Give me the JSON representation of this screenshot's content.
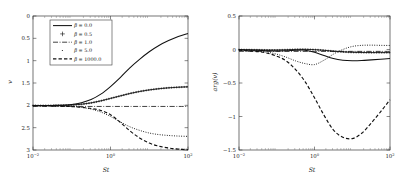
{
  "figure": {
    "background": "#ffffff",
    "ink": "#111111",
    "panels": [
      "magnitude",
      "phase"
    ]
  },
  "chart_data": [
    {
      "type": "line",
      "id": "left-panel",
      "title": "",
      "xlabel": "St",
      "ylabel": "v",
      "xscale": "log",
      "xlim": [
        0.01,
        100
      ],
      "ylim": [
        0,
        3
      ],
      "xticks": [
        "10^-2",
        "10^0",
        "10^2"
      ],
      "xtick_values": [
        0.01,
        1,
        100
      ],
      "yticks": [
        "0",
        "0.5",
        "1",
        "1.5",
        "2",
        "2.5",
        "3"
      ],
      "ytick_values": [
        0,
        0.5,
        1,
        1.5,
        2,
        2.5,
        3
      ],
      "grid": false,
      "legend_position": "upper-left",
      "series": [
        {
          "name": "beta = 0.0",
          "label_value": "0.0",
          "style": "solid",
          "x": [
            0.01,
            0.0178,
            0.0316,
            0.0562,
            0.1,
            0.178,
            0.316,
            0.562,
            1.0,
            1.78,
            3.16,
            5.62,
            10.0,
            17.8,
            31.6,
            56.2,
            100.0
          ],
          "y": [
            0.995,
            0.996,
            0.998,
            1.003,
            1.02,
            1.06,
            1.13,
            1.25,
            1.42,
            1.62,
            1.84,
            2.03,
            2.2,
            2.34,
            2.45,
            2.54,
            2.61
          ]
        },
        {
          "name": "beta = 0.5",
          "label_value": "0.5",
          "style": "plus-markers",
          "x": [
            0.01,
            0.0178,
            0.0316,
            0.0562,
            0.1,
            0.178,
            0.316,
            0.562,
            1.0,
            1.78,
            3.16,
            5.62,
            10.0,
            17.8,
            31.6,
            56.2,
            100.0
          ],
          "y": [
            0.995,
            0.996,
            0.997,
            1.0,
            1.008,
            1.025,
            1.055,
            1.1,
            1.155,
            1.21,
            1.265,
            1.31,
            1.345,
            1.372,
            1.392,
            1.405,
            1.415
          ]
        },
        {
          "name": "beta = 1.0",
          "label_value": "1.0",
          "style": "dash-dot",
          "x": [
            0.01,
            0.1,
            1.0,
            10.0,
            100.0
          ],
          "y": [
            0.975,
            0.975,
            0.975,
            0.975,
            0.975
          ]
        },
        {
          "name": "beta = 5.0",
          "label_value": "5.0",
          "style": "dotted",
          "x": [
            0.01,
            0.0178,
            0.0316,
            0.0562,
            0.1,
            0.178,
            0.316,
            0.562,
            1.0,
            1.78,
            3.16,
            5.62,
            10.0,
            17.8,
            31.6,
            56.2,
            100.0
          ],
          "y": [
            0.993,
            0.992,
            0.99,
            0.985,
            0.975,
            0.955,
            0.915,
            0.85,
            0.75,
            0.63,
            0.52,
            0.44,
            0.38,
            0.345,
            0.325,
            0.312,
            0.305
          ]
        },
        {
          "name": "beta = 1000.0",
          "label_value": "1000.0",
          "style": "dashed",
          "x": [
            0.01,
            0.0178,
            0.0316,
            0.0562,
            0.1,
            0.178,
            0.316,
            0.562,
            1.0,
            1.78,
            3.16,
            5.62,
            10.0,
            17.8,
            31.6,
            56.2,
            100.0
          ],
          "y": [
            0.99,
            0.99,
            0.988,
            0.982,
            0.972,
            0.955,
            0.93,
            0.885,
            0.79,
            0.62,
            0.43,
            0.27,
            0.155,
            0.085,
            0.045,
            0.02,
            0.005
          ]
        }
      ]
    },
    {
      "type": "line",
      "id": "right-panel",
      "title": "",
      "xlabel": "St",
      "ylabel": "arg(v)",
      "xscale": "log",
      "xlim": [
        0.01,
        100
      ],
      "ylim": [
        -1.5,
        0.5
      ],
      "xticks": [
        "10^-2",
        "10^0",
        "10^2"
      ],
      "xtick_values": [
        0.01,
        1,
        100
      ],
      "yticks": [
        "0.5",
        "0",
        "-0.5",
        "-1",
        "-1.5"
      ],
      "ytick_values": [
        0.5,
        0,
        -0.5,
        -1,
        -1.5
      ],
      "grid": false,
      "legend_position": "none",
      "series": [
        {
          "name": "beta = 0.0",
          "label_value": "0.0",
          "style": "solid",
          "x": [
            0.01,
            0.0178,
            0.0316,
            0.0562,
            0.1,
            0.178,
            0.316,
            0.562,
            1.0,
            1.78,
            3.16,
            5.62,
            10.0,
            17.8,
            31.6,
            56.2,
            100.0
          ],
          "y": [
            -0.005,
            -0.008,
            -0.012,
            -0.018,
            -0.022,
            -0.02,
            -0.012,
            -0.01,
            -0.04,
            -0.09,
            -0.135,
            -0.16,
            -0.168,
            -0.165,
            -0.155,
            -0.145,
            -0.135
          ]
        },
        {
          "name": "beta = 0.5",
          "label_value": "0.5",
          "style": "plus-markers",
          "x": [
            0.01,
            0.0178,
            0.0316,
            0.0562,
            0.1,
            0.178,
            0.316,
            0.562,
            1.0,
            1.78,
            3.16,
            5.62,
            10.0,
            17.8,
            31.6,
            56.2,
            100.0
          ],
          "y": [
            -0.003,
            -0.004,
            -0.006,
            -0.008,
            -0.008,
            -0.004,
            0.001,
            0.002,
            -0.002,
            -0.012,
            -0.025,
            -0.035,
            -0.042,
            -0.045,
            -0.046,
            -0.046,
            -0.046
          ]
        },
        {
          "name": "beta = 1.0",
          "label_value": "1.0",
          "style": "dash-dot",
          "x": [
            0.01,
            0.1,
            1.0,
            10.0,
            100.0
          ],
          "y": [
            -0.028,
            -0.028,
            -0.028,
            -0.028,
            -0.028
          ]
        },
        {
          "name": "beta = 5.0",
          "label_value": "5.0",
          "style": "dotted",
          "x": [
            0.01,
            0.0178,
            0.0316,
            0.0562,
            0.1,
            0.178,
            0.316,
            0.562,
            1.0,
            1.78,
            3.16,
            5.62,
            10.0,
            17.8,
            31.6,
            56.2,
            100.0
          ],
          "y": [
            -0.01,
            -0.015,
            -0.022,
            -0.04,
            -0.07,
            -0.115,
            -0.17,
            -0.21,
            -0.225,
            -0.16,
            -0.07,
            0.0,
            0.045,
            0.062,
            0.065,
            0.062,
            0.06
          ]
        },
        {
          "name": "beta = 1000.0",
          "label_value": "1000.0",
          "style": "dashed",
          "x": [
            0.01,
            0.0178,
            0.0316,
            0.0562,
            0.1,
            0.178,
            0.316,
            0.562,
            1.0,
            1.78,
            3.16,
            5.62,
            10.0,
            17.8,
            31.6,
            56.2,
            100.0
          ],
          "y": [
            -0.012,
            -0.02,
            -0.032,
            -0.055,
            -0.1,
            -0.17,
            -0.3,
            -0.48,
            -0.72,
            -0.98,
            -1.2,
            -1.31,
            -1.33,
            -1.25,
            -1.1,
            -0.93,
            -0.75
          ]
        }
      ]
    }
  ],
  "legend": {
    "symbol": "β",
    "equals": "=",
    "entries": [
      {
        "label": "0.0",
        "style": "solid"
      },
      {
        "label": "0.5",
        "style": "plus-markers"
      },
      {
        "label": "1.0",
        "style": "dash-dot"
      },
      {
        "label": "5.0",
        "style": "dotted"
      },
      {
        "label": "1000.0",
        "style": "dashed"
      }
    ]
  },
  "axes": {
    "left": {
      "xlabel": "St",
      "ylabel": "v",
      "xticks": [
        {
          "base": "10",
          "exp": "−2"
        },
        {
          "base": "10",
          "exp": "0"
        },
        {
          "base": "10",
          "exp": "2"
        }
      ],
      "yticks": [
        "3",
        "2.5",
        "2",
        "1.5",
        "1",
        "0.5",
        "0"
      ]
    },
    "right": {
      "xlabel": "St",
      "ylabel": "arg(v)",
      "xticks": [
        {
          "base": "10",
          "exp": "−2"
        },
        {
          "base": "10",
          "exp": "0"
        },
        {
          "base": "10",
          "exp": "2"
        }
      ],
      "yticks": [
        "0.5",
        "0",
        "−0.5",
        "−1",
        "−1.5"
      ]
    }
  }
}
